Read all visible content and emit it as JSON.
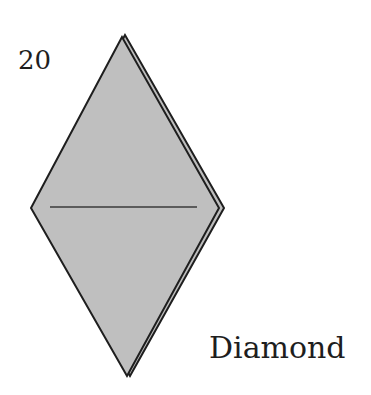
{
  "figure": {
    "number": "20",
    "caption": "Diamond",
    "shape": {
      "type": "diamond",
      "fill": "#bdbdbd",
      "stroke": "#1e1e1e",
      "vertices": {
        "top": [
          123,
          35
        ],
        "left": [
          31,
          208
        ],
        "right": [
          222,
          208
        ],
        "bottom": [
          128,
          376
        ]
      },
      "fold_line": {
        "x1": 50,
        "y1": 207,
        "x2": 197,
        "y2": 207,
        "color": "#3a3a3a"
      }
    }
  }
}
